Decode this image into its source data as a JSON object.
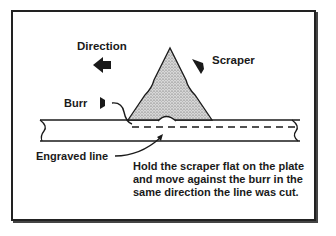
{
  "diagram": {
    "labels": {
      "direction": "Direction",
      "scraper": "Scraper",
      "burr": "Burr",
      "engraved_line": "Engraved line"
    },
    "instruction": "Hold the scraper flat on the plate and move against the burr in the same direction the line was cut.",
    "colors": {
      "ink": "#1a1a1a",
      "background": "#ffffff",
      "stipple": "#999999"
    }
  }
}
